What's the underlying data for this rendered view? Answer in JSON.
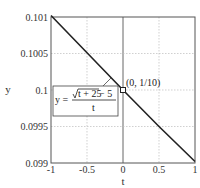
{
  "chart_data": {
    "type": "line",
    "title": "",
    "xlabel": "t",
    "ylabel": "y",
    "xlim": [
      -1,
      1
    ],
    "ylim": [
      0.099,
      0.101
    ],
    "grid": true,
    "x_ticks": [
      -1,
      -0.5,
      0,
      0.5,
      1
    ],
    "x_tick_labels": [
      "-1",
      "-0.5",
      "0",
      "0.5",
      "1"
    ],
    "y_ticks": [
      0.099,
      0.0995,
      0.1,
      0.1005,
      0.101
    ],
    "y_tick_labels": [
      "0.099",
      "0.0995",
      "0.1",
      "0.1005",
      "0.101"
    ],
    "series": [
      {
        "name": "y = (sqrt(t + 25) - 5) / t",
        "x": [
          -1,
          -0.5,
          0,
          0.5,
          1
        ],
        "y": [
          0.10102,
          0.10051,
          0.1,
          0.0995,
          0.09902
        ]
      }
    ],
    "hole_point": {
      "x": 0,
      "y": 0.1,
      "label": "(0, 1/10)"
    },
    "formula": {
      "lhs": "y =",
      "numerator_radicand": "t + 25",
      "numerator_rest": " − 5",
      "denominator": "t"
    }
  }
}
